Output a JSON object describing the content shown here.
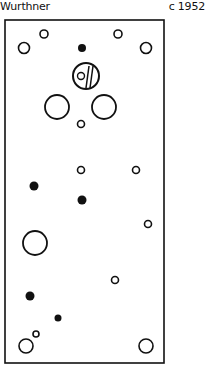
{
  "header": {
    "maker": "Wurthner",
    "date": "c 1952"
  },
  "colors": {
    "ink": "#111111",
    "paper": "#ffffff"
  },
  "panel": {
    "outline": {
      "x": 5,
      "y": 20,
      "width": 159,
      "height": 343,
      "stroke_width": 1.6
    },
    "holes": [
      {
        "id": "top-left-corner-hole",
        "type": "ring",
        "cx": 24,
        "cy": 48,
        "r": 5.5
      },
      {
        "id": "top-left-small-hole",
        "type": "ring",
        "cx": 44,
        "cy": 34,
        "r": 4
      },
      {
        "id": "top-center-dot",
        "type": "dot",
        "cx": 82,
        "cy": 48,
        "r": 4
      },
      {
        "id": "top-right-small-hole",
        "type": "ring",
        "cx": 118,
        "cy": 34,
        "r": 4
      },
      {
        "id": "top-right-corner-hole",
        "type": "ring",
        "cx": 146,
        "cy": 48,
        "r": 5.5
      },
      {
        "id": "left-large-hole",
        "type": "ring",
        "cx": 57,
        "cy": 107,
        "r": 12
      },
      {
        "id": "right-large-hole",
        "type": "ring",
        "cx": 104,
        "cy": 107,
        "r": 12
      },
      {
        "id": "center-small-hole",
        "type": "ring",
        "cx": 81,
        "cy": 124,
        "r": 3.5
      },
      {
        "id": "mid-ring-1",
        "type": "ring",
        "cx": 81,
        "cy": 170,
        "r": 3.5
      },
      {
        "id": "mid-ring-2",
        "type": "ring",
        "cx": 136,
        "cy": 170,
        "r": 3.5
      },
      {
        "id": "left-dot-1",
        "type": "dot",
        "cx": 34,
        "cy": 186,
        "r": 4.5
      },
      {
        "id": "center-dot-2",
        "type": "dot",
        "cx": 82,
        "cy": 200,
        "r": 4.5
      },
      {
        "id": "right-ring-3",
        "type": "ring",
        "cx": 148,
        "cy": 224,
        "r": 3.5
      },
      {
        "id": "lower-left-large-hole",
        "type": "ring",
        "cx": 35,
        "cy": 243,
        "r": 12
      },
      {
        "id": "lower-ring-4",
        "type": "ring",
        "cx": 115,
        "cy": 280,
        "r": 3.5
      },
      {
        "id": "lower-left-dot",
        "type": "dot",
        "cx": 30,
        "cy": 296,
        "r": 4.5
      },
      {
        "id": "lower-center-dot",
        "type": "dot",
        "cx": 58,
        "cy": 318,
        "r": 3.5
      },
      {
        "id": "bottom-left-tiny-hole",
        "type": "ring",
        "cx": 36,
        "cy": 334,
        "r": 3
      },
      {
        "id": "bottom-left-corner-hole",
        "type": "ring",
        "cx": 26,
        "cy": 346,
        "r": 7
      },
      {
        "id": "bottom-right-corner-hole",
        "type": "ring",
        "cx": 146,
        "cy": 346,
        "r": 7
      }
    ],
    "meter": {
      "id": "meter-knob",
      "cx": 86,
      "cy": 76,
      "r": 13,
      "inner_circle": {
        "cx": 81,
        "cy": 76,
        "r": 3.5
      },
      "bars": [
        {
          "x1": 89,
          "y1": 66,
          "x2": 86,
          "y2": 88
        },
        {
          "x1": 93,
          "y1": 66,
          "x2": 90,
          "y2": 88
        }
      ]
    }
  }
}
